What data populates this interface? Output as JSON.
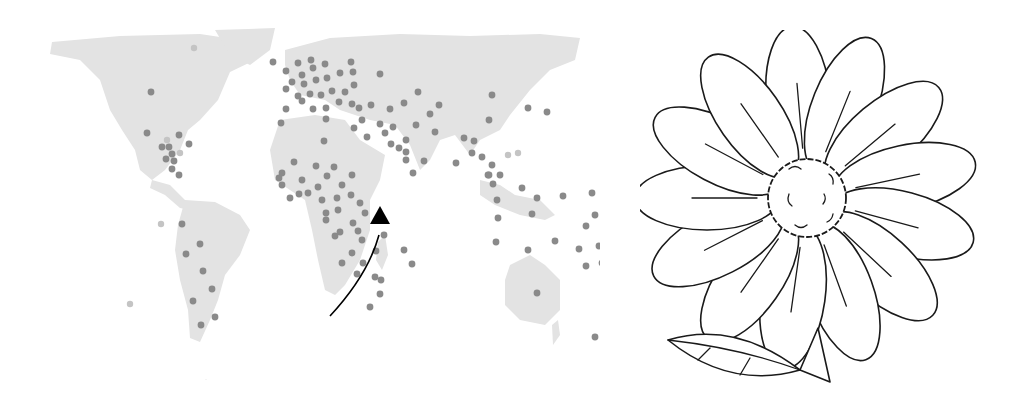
{
  "figure": {
    "left_panel": {
      "type": "world-map-dot-plot",
      "land_color": "#e3e3e3",
      "dot_color": "#8a8a8a",
      "faint_dot_color": "#c4c4c4",
      "arrow_color": "#000000",
      "arrow_description": "curved arrow from southern Africa pointing north-east toward the Indian Ocean"
    },
    "right_panel": {
      "type": "line-drawing",
      "subject": "daisy flower with leaf",
      "stroke_color": "#1a1a1a",
      "fill_color": "#ffffff"
    }
  },
  "icons": {
    "arrow": "triangle-arrow"
  }
}
